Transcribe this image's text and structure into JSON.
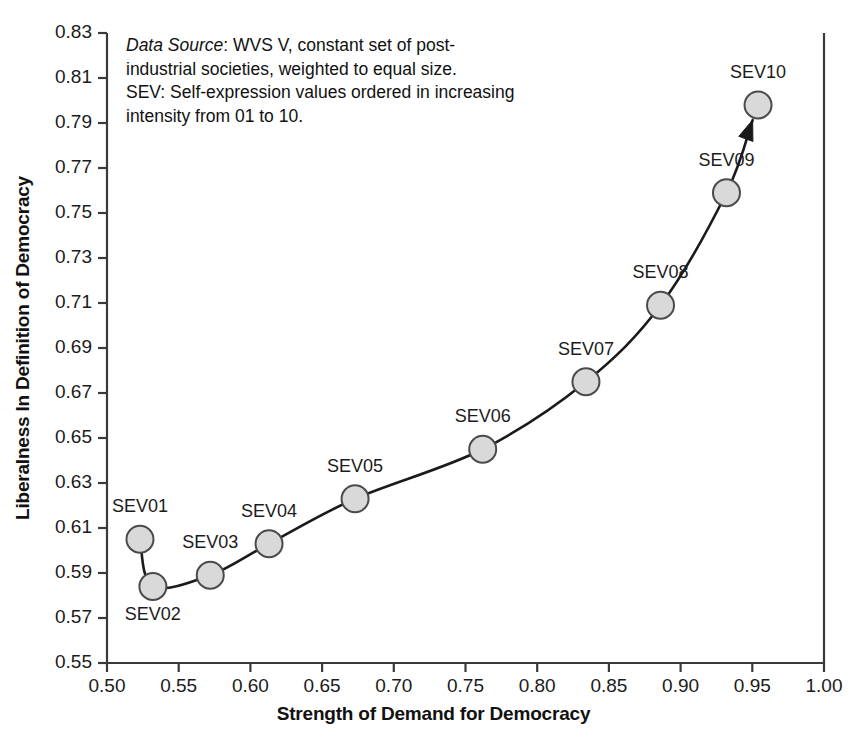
{
  "chart_data": {
    "type": "scatter",
    "title": "",
    "xlabel": "Strength of Demand for Democracy",
    "ylabel": "Liberalness In Definition of Democracy",
    "xlim": [
      0.5,
      1.0
    ],
    "ylim": [
      0.55,
      0.83
    ],
    "xticks": [
      "0.50",
      "0.55",
      "0.60",
      "0.65",
      "0.70",
      "0.75",
      "0.80",
      "0.85",
      "0.90",
      "0.95",
      "1.00"
    ],
    "yticks": [
      "0.55",
      "0.57",
      "0.59",
      "0.61",
      "0.63",
      "0.65",
      "0.67",
      "0.69",
      "0.71",
      "0.73",
      "0.75",
      "0.77",
      "0.79",
      "0.81",
      "0.83"
    ],
    "grid": false,
    "legend": "none",
    "series": [
      {
        "name": "SEV 01-10",
        "points": [
          {
            "label": "SEV01",
            "x": 0.523,
            "y": 0.605,
            "label_pos": "above"
          },
          {
            "label": "SEV02",
            "x": 0.532,
            "y": 0.584,
            "label_pos": "below"
          },
          {
            "label": "SEV03",
            "x": 0.572,
            "y": 0.589,
            "label_pos": "above"
          },
          {
            "label": "SEV04",
            "x": 0.613,
            "y": 0.603,
            "label_pos": "above"
          },
          {
            "label": "SEV05",
            "x": 0.673,
            "y": 0.623,
            "label_pos": "above"
          },
          {
            "label": "SEV06",
            "x": 0.762,
            "y": 0.645,
            "label_pos": "above"
          },
          {
            "label": "SEV07",
            "x": 0.834,
            "y": 0.675,
            "label_pos": "above"
          },
          {
            "label": "SEV08",
            "x": 0.886,
            "y": 0.709,
            "label_pos": "above"
          },
          {
            "label": "SEV09",
            "x": 0.932,
            "y": 0.759,
            "label_pos": "above"
          },
          {
            "label": "SEV10",
            "x": 0.954,
            "y": 0.798,
            "label_pos": "above"
          }
        ]
      }
    ],
    "annotations": [
      {
        "name": "data-source-note",
        "line1_em": "Data Source",
        "line1_rest": ": WVS V, constant set of post-",
        "line2": "industrial societies, weighted to equal size.",
        "line3": "SEV: Self-expression values ordered in increasing",
        "line4": "intensity from 01 to 10."
      }
    ],
    "style": {
      "marker_fill": "#d9d9d9",
      "marker_stroke": "#4a4a4a",
      "curve_color": "#1a1a1a",
      "axis_color": "#3a3a3a",
      "background": "#ffffff",
      "arrow_at_end": true
    }
  }
}
